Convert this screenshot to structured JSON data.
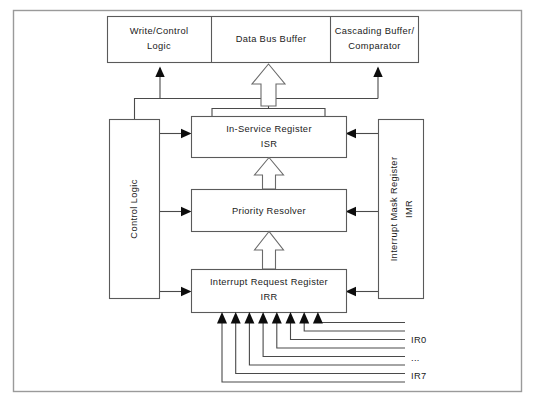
{
  "diagram": {
    "top_row": [
      {
        "id": "write-control-logic",
        "line1": "Write/Control",
        "line2": "Logic"
      },
      {
        "id": "data-bus-buffer",
        "line1": "Data  Bus  Buffer",
        "line2": ""
      },
      {
        "id": "cascading-buffer-comparator",
        "line1": "Cascading  Buffer/",
        "line2": "Comparator"
      }
    ],
    "center_blocks": [
      {
        "id": "in-service-register",
        "line1": "In-Service  Register",
        "line2": "ISR"
      },
      {
        "id": "priority-resolver",
        "line1": "Priority  Resolver",
        "line2": ""
      },
      {
        "id": "interrupt-request-register",
        "line1": "Interrupt  Request  Register",
        "line2": "IRR"
      }
    ],
    "left_block": {
      "id": "control-logic",
      "line1": "Control  Logic",
      "line2": ""
    },
    "right_block": {
      "id": "interrupt-mask-register",
      "line1": "Interrupt  Mask  Register",
      "line2": "IMR"
    },
    "interrupt_lines": [
      {
        "id": "ir0",
        "label": "IR0"
      },
      {
        "id": "ir-ellipsis",
        "label": "..."
      },
      {
        "id": "ir7",
        "label": "IR7"
      }
    ],
    "colors": {
      "background": "#ffffff",
      "box_stroke": "#5a5a5a",
      "frame_stroke": "#9a9a9a",
      "connector": "#4a4a4a",
      "text": "#1a1a1a",
      "arrow_solid": "#0d0d0d",
      "arrow_hollow_fill": "#ffffff"
    }
  }
}
